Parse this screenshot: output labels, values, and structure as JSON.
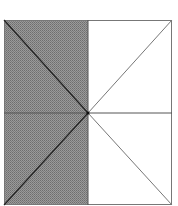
{
  "figure": {
    "square": {
      "x": 4,
      "y": 20,
      "width": 168,
      "height": 185
    },
    "center": {
      "x": 88,
      "y": 113
    },
    "shaded_region": "left half",
    "colors": {
      "shade": "#8a8a8a",
      "line": "#555555",
      "background": "#ffffff"
    },
    "triangles_total": 8,
    "triangles_shaded": 4
  }
}
